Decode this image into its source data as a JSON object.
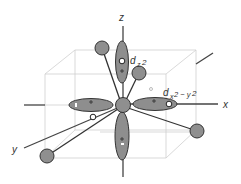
{
  "diagram": {
    "type": "d-orbital octahedral ligand field",
    "axes": {
      "x": "x",
      "y": "y",
      "z": "z"
    },
    "orbitals": [
      {
        "name": "d_z2",
        "label_main": "d",
        "label_sub": "z",
        "label_sup": "2"
      },
      {
        "name": "d_x2-y2",
        "label_main": "d",
        "label_sub": "x",
        "label_sub2": "2 − y",
        "label_sup": "2"
      }
    ],
    "lobe_sign": "+",
    "colors": {
      "lobe_fill": "#8e8e8e",
      "ligand_fill": "#8f8f8f",
      "outline": "#333333",
      "axis": "#444444",
      "box": "#cfcfcf"
    },
    "ligand_count": 4,
    "electron_markers": 4
  }
}
